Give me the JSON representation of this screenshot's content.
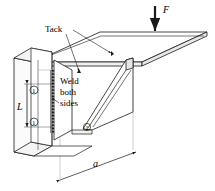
{
  "figure": {
    "type": "engineering-diagram",
    "background_color": "#ffffff",
    "line_color": "#1a1a1a",
    "fill_color": "#f2f2f2"
  },
  "annotations": {
    "tack_label": "Tack",
    "weld_line_1": "Weld",
    "weld_line_2": "both",
    "weld_line_3": "sides",
    "force_label": "F",
    "length_label": "L",
    "distance_label": "a",
    "weld_size_top": "①",
    "weld_size_bottom": "①",
    "weld_size_gusset": "①"
  }
}
